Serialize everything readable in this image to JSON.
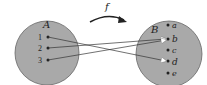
{
  "diagram": {
    "function_label": "f",
    "domain": {
      "label": "A",
      "elements": [
        "1",
        "2",
        "3"
      ]
    },
    "codomain": {
      "label": "B",
      "elements": [
        "a",
        "b",
        "c",
        "d",
        "e"
      ]
    },
    "mappings": [
      {
        "from": "1",
        "to": "d"
      },
      {
        "from": "2",
        "to": "b"
      },
      {
        "from": "3",
        "to": "b"
      }
    ],
    "colors": {
      "set_fill": "#a9a9a9",
      "set_stroke": "#555555",
      "arrow": "#333333",
      "arrowhead": "#ffffff"
    }
  }
}
